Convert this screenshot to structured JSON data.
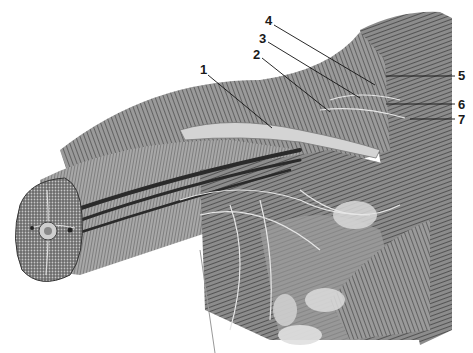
{
  "figure": {
    "colors": {
      "background": "#ffffff",
      "ink": "#1a1a1a",
      "mid": "#7a7a7a",
      "light": "#cfcfcf"
    }
  },
  "labels": [
    {
      "text": "1",
      "x": 200,
      "y": 63,
      "line": [
        208,
        75,
        272,
        128
      ]
    },
    {
      "text": "2",
      "x": 253,
      "y": 48,
      "line": [
        262,
        58,
        330,
        112
      ]
    },
    {
      "text": "3",
      "x": 259,
      "y": 32,
      "line": [
        268,
        42,
        360,
        98
      ]
    },
    {
      "text": "4",
      "x": 265,
      "y": 14,
      "line": [
        274,
        25,
        375,
        85
      ]
    },
    {
      "text": "5",
      "x": 458,
      "y": 69,
      "line": [
        455,
        76,
        386,
        76
      ]
    },
    {
      "text": "6",
      "x": 458,
      "y": 98,
      "line": [
        455,
        104,
        386,
        104
      ]
    },
    {
      "text": "7",
      "x": 458,
      "y": 113,
      "line": [
        455,
        119,
        410,
        119
      ]
    }
  ]
}
